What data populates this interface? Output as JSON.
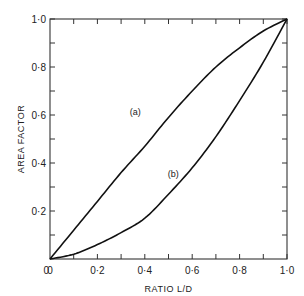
{
  "chart_data": {
    "type": "line",
    "title": "",
    "xlabel": "RATIO L/D",
    "ylabel": "AREA FACTOR",
    "xlim": [
      0,
      1.0
    ],
    "ylim": [
      0,
      1.0
    ],
    "grid": false,
    "legend": "inline labels",
    "x_ticks": [
      0,
      0.1,
      0.2,
      0.3,
      0.4,
      0.5,
      0.6,
      0.7,
      0.8,
      0.9,
      1.0
    ],
    "x_tick_labels": [
      "0",
      "0·2",
      "0·4",
      "0·6",
      "0·8",
      "1·0"
    ],
    "x_tick_label_values": [
      0,
      0.2,
      0.4,
      0.6,
      0.8,
      1.0
    ],
    "y_ticks": [
      0.1,
      0.2,
      0.3,
      0.4,
      0.5,
      0.6,
      0.7,
      0.8,
      0.9,
      1.0
    ],
    "y_tick_labels": [
      "0·2",
      "0·4",
      "0·6",
      "0·8",
      "1·0"
    ],
    "y_tick_label_values": [
      0.2,
      0.4,
      0.6,
      0.8,
      1.0
    ],
    "origin_label": "0",
    "x": [
      0,
      0.1,
      0.2,
      0.3,
      0.4,
      0.5,
      0.6,
      0.7,
      0.8,
      0.9,
      1.0
    ],
    "series": [
      {
        "name": "(a)",
        "label_pos": [
          0.36,
          0.6
        ],
        "values": [
          0,
          0.12,
          0.24,
          0.36,
          0.47,
          0.59,
          0.7,
          0.8,
          0.88,
          0.95,
          1.0
        ]
      },
      {
        "name": "(b)",
        "label_pos": [
          0.52,
          0.34
        ],
        "values": [
          0,
          0.02,
          0.06,
          0.11,
          0.17,
          0.27,
          0.38,
          0.51,
          0.66,
          0.82,
          1.0
        ]
      }
    ]
  }
}
